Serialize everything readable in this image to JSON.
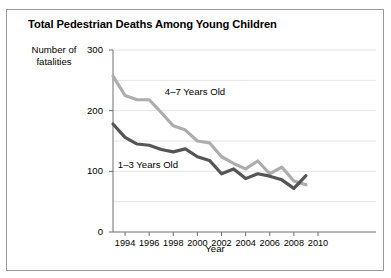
{
  "figure": {
    "width": 391,
    "height": 278,
    "background": "#ffffff",
    "border_color": "#9a9a9a"
  },
  "chart_data": {
    "type": "line",
    "title": "Total Pedestrian Deaths Among Young Children",
    "xlabel": "Year",
    "ylabel": "Number of fatalities",
    "ylabel_line1": "Number of",
    "ylabel_line2": "fatalities",
    "xlim": [
      1993,
      2010
    ],
    "ylim": [
      0,
      300
    ],
    "yticks": [
      0,
      100,
      200,
      300
    ],
    "ytick_labels": [
      "0",
      "100",
      "200",
      "300"
    ],
    "gridlines": [
      0,
      50,
      100,
      150,
      200,
      250,
      300
    ],
    "grid": true,
    "grid_color": "#e4e4e4",
    "xticks": [
      1994,
      1996,
      1998,
      2000,
      2002,
      2004,
      2006,
      2008,
      2010
    ],
    "xtick_labels": [
      "1994",
      "1996",
      "1998",
      "2000",
      "2002",
      "2004",
      "2006",
      "2008",
      "2010"
    ],
    "legend_position": "inline-annotations",
    "x": [
      1993,
      1994,
      1995,
      1996,
      1997,
      1998,
      1999,
      2000,
      2001,
      2002,
      2003,
      2004,
      2005,
      2006,
      2007,
      2008,
      2009
    ],
    "series": [
      {
        "name": "4-7 Years Old",
        "label": "4–7 Years Old",
        "color": "#adadad",
        "values": [
          257,
          225,
          218,
          218,
          197,
          175,
          168,
          150,
          147,
          124,
          113,
          104,
          117,
          96,
          107,
          84,
          78
        ]
      },
      {
        "name": "1-3 Years Old",
        "label": "1–3 Years Old",
        "color": "#555555",
        "values": [
          178,
          156,
          145,
          143,
          136,
          132,
          137,
          124,
          118,
          96,
          104,
          88,
          96,
          92,
          86,
          72,
          93
        ]
      }
    ],
    "annotations": [
      {
        "text": "4–7 Years Old",
        "x": 1997.3,
        "y": 231
      },
      {
        "text": "1–3 Years Old",
        "x": 1993.4,
        "y": 110
      }
    ]
  }
}
